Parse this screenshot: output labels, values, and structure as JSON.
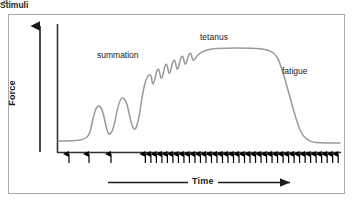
{
  "figure": {
    "panel_letter": "a.",
    "frame_color": "#a8a8a8",
    "background": "#ffffff"
  },
  "axes": {
    "y_label": "Force",
    "x_label": "Time",
    "stimuli_label": "Stimuli",
    "axis_color": "#1a1a1a"
  },
  "annotations": {
    "summation": "summation",
    "tetanus": "tetanus",
    "fatigue": "fatigue"
  },
  "chart_data": {
    "type": "line",
    "xlabel": "Time",
    "ylabel": "Force",
    "curve_color": "#999999",
    "grid": false,
    "legend": null,
    "axis_ticks": false,
    "xlim": [
      0,
      100
    ],
    "ylim": [
      0,
      100
    ],
    "annotations": [
      {
        "text": "summation",
        "x": 16,
        "y": 72
      },
      {
        "text": "tetanus",
        "x": 52,
        "y": 84
      },
      {
        "text": "fatigue",
        "x": 80,
        "y": 60
      },
      {
        "text": "Stimuli",
        "x": 3,
        "y": -10
      }
    ],
    "series": [
      {
        "name": "Force",
        "x": [
          0,
          3,
          6,
          8,
          10,
          11.5,
          13,
          14.5,
          16,
          17.5,
          19,
          20.5,
          22,
          23.5,
          25,
          26,
          27,
          28,
          29,
          30,
          31,
          32,
          33,
          34,
          35,
          36,
          37,
          38,
          39,
          40,
          41,
          42,
          43,
          44,
          45,
          46,
          47,
          48,
          50,
          55,
          60,
          65,
          70,
          73,
          75,
          77,
          79,
          81,
          83,
          85,
          87,
          89,
          91,
          94,
          97,
          100
        ],
        "y": [
          8,
          8,
          8,
          9,
          11,
          16,
          30,
          38,
          32,
          20,
          16,
          30,
          46,
          52,
          44,
          30,
          26,
          44,
          62,
          70,
          74,
          70,
          76,
          71,
          78,
          73,
          80,
          75,
          82,
          77,
          83,
          79,
          84,
          81,
          85,
          83,
          86,
          87,
          88,
          88,
          88,
          88,
          87,
          86,
          83,
          76,
          64,
          50,
          36,
          24,
          16,
          12,
          10,
          9,
          9,
          9
        ]
      }
    ],
    "stimuli_markers": {
      "label": "Stimuli",
      "sparse_positions": [
        7,
        14.5,
        22
      ],
      "dense_start": 31,
      "dense_end": 99,
      "dense_count": 36,
      "marker": "up-arrow"
    },
    "phases": [
      {
        "name": "rest",
        "x_range": [
          0,
          6
        ]
      },
      {
        "name": "single twitches",
        "x_range": [
          6,
          25
        ]
      },
      {
        "name": "summation",
        "x_range": [
          25,
          40
        ]
      },
      {
        "name": "incomplete tetanus",
        "x_range": [
          33,
          47
        ]
      },
      {
        "name": "complete tetanus",
        "x_range": [
          47,
          72
        ]
      },
      {
        "name": "fatigue",
        "x_range": [
          72,
          100
        ]
      }
    ]
  }
}
